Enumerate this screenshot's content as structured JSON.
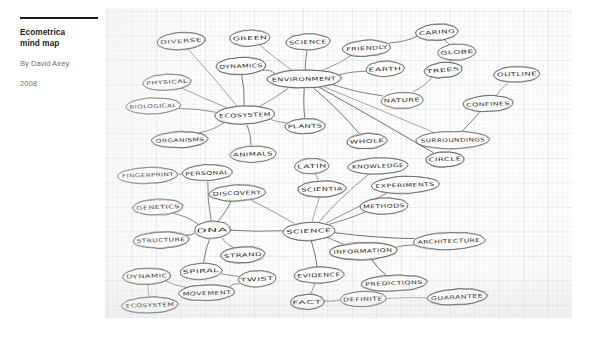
{
  "caption": {
    "title_line1": "Ecometrica",
    "title_line2": "mind map",
    "byline": "By David Airey",
    "year": "2008"
  },
  "artwork": {
    "medium": "hand-drawn mind map on graph paper",
    "ink_color": "#2c2c30",
    "paper_color": "#fdfdfc",
    "grid_color": "#8aa0b4"
  },
  "chart_data": {
    "type": "diagram",
    "title": "Ecometrica mind map",
    "nodes": [
      {
        "id": "diverse",
        "label": "DIVERSE",
        "x": 76,
        "y": 33,
        "rx": 24,
        "ry": 8.5,
        "rot": -4
      },
      {
        "id": "green",
        "label": "GREEN",
        "x": 145,
        "y": 30,
        "rx": 20,
        "ry": 8,
        "rot": -2
      },
      {
        "id": "science_top",
        "label": "SCIENCE",
        "x": 203,
        "y": 34,
        "rx": 22,
        "ry": 8,
        "rot": -2
      },
      {
        "id": "friendly",
        "label": "FRIENDLY",
        "x": 262,
        "y": 40,
        "rx": 24,
        "ry": 8,
        "rot": -3
      },
      {
        "id": "caring",
        "label": "CARING",
        "x": 332,
        "y": 24,
        "rx": 21,
        "ry": 8,
        "rot": -4
      },
      {
        "id": "globe",
        "label": "GLOBE",
        "x": 352,
        "y": 44,
        "rx": 19,
        "ry": 8,
        "rot": -3
      },
      {
        "id": "dynamics",
        "label": "DYNAMICS",
        "x": 136,
        "y": 58,
        "rx": 25,
        "ry": 8.5,
        "rot": -2
      },
      {
        "id": "earth",
        "label": "EARTH",
        "x": 280,
        "y": 61,
        "rx": 19,
        "ry": 7.5,
        "rot": -2
      },
      {
        "id": "trees",
        "label": "TREES",
        "x": 338,
        "y": 62,
        "rx": 19,
        "ry": 7.5,
        "rot": -5
      },
      {
        "id": "outline",
        "label": "OUTLINE",
        "x": 412,
        "y": 66,
        "rx": 23,
        "ry": 8,
        "rot": -2
      },
      {
        "id": "environment",
        "label": "ENVIRONMENT",
        "x": 199,
        "y": 71,
        "rx": 37,
        "ry": 9,
        "rot": -1
      },
      {
        "id": "physical",
        "label": "PHYSICAL",
        "x": 62,
        "y": 74,
        "rx": 24,
        "ry": 8,
        "rot": -3
      },
      {
        "id": "nature",
        "label": "NATURE",
        "x": 297,
        "y": 92,
        "rx": 21,
        "ry": 8,
        "rot": -2
      },
      {
        "id": "confines",
        "label": "CONFINES",
        "x": 383,
        "y": 96,
        "rx": 25,
        "ry": 8,
        "rot": -2
      },
      {
        "id": "biological",
        "label": "BIOLOGICAL",
        "x": 48,
        "y": 98,
        "rx": 27,
        "ry": 8,
        "rot": -2
      },
      {
        "id": "ecosystem_top",
        "label": "ECOSYSTEM",
        "x": 140,
        "y": 107,
        "rx": 30,
        "ry": 9,
        "rot": -2
      },
      {
        "id": "plants",
        "label": "PLANTS",
        "x": 200,
        "y": 118,
        "rx": 20,
        "ry": 7.5,
        "rot": -2
      },
      {
        "id": "whole",
        "label": "WHOLE",
        "x": 262,
        "y": 133,
        "rx": 20,
        "ry": 7.5,
        "rot": -3
      },
      {
        "id": "surroundings",
        "label": "SURROUNDINGS",
        "x": 348,
        "y": 132,
        "rx": 37,
        "ry": 8.5,
        "rot": -1
      },
      {
        "id": "organisms",
        "label": "ORGANISMS",
        "x": 75,
        "y": 132,
        "rx": 28,
        "ry": 8,
        "rot": -2
      },
      {
        "id": "animals",
        "label": "ANIMALS",
        "x": 148,
        "y": 146,
        "rx": 23,
        "ry": 8,
        "rot": -2
      },
      {
        "id": "circle",
        "label": "CIRCLE",
        "x": 340,
        "y": 151,
        "rx": 19,
        "ry": 7.5,
        "rot": -2
      },
      {
        "id": "latin",
        "label": "LATIN",
        "x": 207,
        "y": 158,
        "rx": 17,
        "ry": 7.5,
        "rot": -2
      },
      {
        "id": "knowledge",
        "label": "KNOWLEDGE",
        "x": 273,
        "y": 158,
        "rx": 30,
        "ry": 8,
        "rot": -2
      },
      {
        "id": "fingerprint",
        "label": "FINGERPRINT",
        "x": 43,
        "y": 167,
        "rx": 30,
        "ry": 8,
        "rot": -2
      },
      {
        "id": "personal",
        "label": "PERSONAL",
        "x": 102,
        "y": 165,
        "rx": 25,
        "ry": 8,
        "rot": -2
      },
      {
        "id": "experiments",
        "label": "EXPERIMENTS",
        "x": 300,
        "y": 177,
        "rx": 34,
        "ry": 8.5,
        "rot": -2
      },
      {
        "id": "scientia",
        "label": "SCIENTIA",
        "x": 217,
        "y": 181,
        "rx": 24,
        "ry": 8,
        "rot": -2
      },
      {
        "id": "discovery",
        "label": "DISCOVERY",
        "x": 132,
        "y": 185,
        "rx": 28,
        "ry": 8,
        "rot": -2
      },
      {
        "id": "methods",
        "label": "METHODS",
        "x": 279,
        "y": 198,
        "rx": 24,
        "ry": 8,
        "rot": -2
      },
      {
        "id": "genetics",
        "label": "GENETICS",
        "x": 53,
        "y": 199,
        "rx": 25,
        "ry": 8,
        "rot": -2
      },
      {
        "id": "science_main",
        "label": "SCIENCE",
        "x": 204,
        "y": 223,
        "rx": 26,
        "ry": 9,
        "rot": -2
      },
      {
        "id": "dna",
        "label": "DNA",
        "x": 107,
        "y": 222,
        "rx": 18,
        "ry": 8.5,
        "rot": -2
      },
      {
        "id": "architecture",
        "label": "ARCHITECTURE",
        "x": 344,
        "y": 233,
        "rx": 36,
        "ry": 8.5,
        "rot": -2
      },
      {
        "id": "information",
        "label": "INFORMATION",
        "x": 258,
        "y": 243,
        "rx": 34,
        "ry": 8.5,
        "rot": -2
      },
      {
        "id": "structure",
        "label": "STRUCTURE",
        "x": 56,
        "y": 232,
        "rx": 28,
        "ry": 8,
        "rot": -2
      },
      {
        "id": "strand",
        "label": "STRAND",
        "x": 138,
        "y": 247,
        "rx": 22,
        "ry": 8,
        "rot": -3
      },
      {
        "id": "spiral",
        "label": "SPIRAL",
        "x": 96,
        "y": 263,
        "rx": 21,
        "ry": 8,
        "rot": -3
      },
      {
        "id": "twist",
        "label": "TWIST",
        "x": 152,
        "y": 271,
        "rx": 19,
        "ry": 8,
        "rot": -3
      },
      {
        "id": "evidence",
        "label": "EVIDENCE",
        "x": 214,
        "y": 267,
        "rx": 25,
        "ry": 8,
        "rot": -2
      },
      {
        "id": "predictions",
        "label": "PREDICTIONS",
        "x": 289,
        "y": 275,
        "rx": 33,
        "ry": 8,
        "rot": -2
      },
      {
        "id": "dynamic",
        "label": "DYNAMIC",
        "x": 42,
        "y": 268,
        "rx": 24,
        "ry": 8,
        "rot": -2
      },
      {
        "id": "movement",
        "label": "MOVEMENT",
        "x": 102,
        "y": 285,
        "rx": 28,
        "ry": 8,
        "rot": -2
      },
      {
        "id": "fact",
        "label": "FACT",
        "x": 202,
        "y": 294,
        "rx": 17,
        "ry": 7.5,
        "rot": -2
      },
      {
        "id": "definite",
        "label": "DEFINITE",
        "x": 258,
        "y": 291,
        "rx": 23,
        "ry": 7.5,
        "rot": -2
      },
      {
        "id": "guarantee",
        "label": "GUARANTEE",
        "x": 352,
        "y": 289,
        "rx": 30,
        "ry": 8,
        "rot": -3
      },
      {
        "id": "ecosystem_bot",
        "label": "ECOSYSTEM",
        "x": 45,
        "y": 297,
        "rx": 28,
        "ry": 8,
        "rot": -2
      }
    ],
    "edges": [
      [
        "environment",
        "green"
      ],
      [
        "environment",
        "science_top"
      ],
      [
        "environment",
        "friendly"
      ],
      [
        "environment",
        "earth"
      ],
      [
        "environment",
        "nature"
      ],
      [
        "environment",
        "whole"
      ],
      [
        "environment",
        "surroundings"
      ],
      [
        "environment",
        "plants"
      ],
      [
        "environment",
        "ecosystem_top"
      ],
      [
        "environment",
        "dynamics"
      ],
      [
        "environment",
        "circle"
      ],
      [
        "friendly",
        "caring"
      ],
      [
        "caring",
        "globe"
      ],
      [
        "globe",
        "trees"
      ],
      [
        "trees",
        "nature"
      ],
      [
        "outline",
        "confines"
      ],
      [
        "confines",
        "surroundings"
      ],
      [
        "ecosystem_top",
        "diverse"
      ],
      [
        "ecosystem_top",
        "physical"
      ],
      [
        "ecosystem_top",
        "biological"
      ],
      [
        "ecosystem_top",
        "organisms"
      ],
      [
        "ecosystem_top",
        "animals"
      ],
      [
        "ecosystem_top",
        "dynamics"
      ],
      [
        "ecosystem_top",
        "plants"
      ],
      [
        "science_main",
        "scientia"
      ],
      [
        "science_main",
        "knowledge"
      ],
      [
        "science_main",
        "experiments"
      ],
      [
        "science_main",
        "methods"
      ],
      [
        "science_main",
        "discovery"
      ],
      [
        "science_main",
        "information"
      ],
      [
        "science_main",
        "evidence"
      ],
      [
        "science_main",
        "dna"
      ],
      [
        "science_main",
        "architecture"
      ],
      [
        "scientia",
        "latin"
      ],
      [
        "dna",
        "personal"
      ],
      [
        "dna",
        "genetics"
      ],
      [
        "dna",
        "structure"
      ],
      [
        "dna",
        "strand"
      ],
      [
        "dna",
        "spiral"
      ],
      [
        "dna",
        "discovery"
      ],
      [
        "personal",
        "fingerprint"
      ],
      [
        "spiral",
        "twist"
      ],
      [
        "twist",
        "movement"
      ],
      [
        "movement",
        "dynamic"
      ],
      [
        "dynamic",
        "ecosystem_bot"
      ],
      [
        "information",
        "predictions"
      ],
      [
        "information",
        "architecture"
      ],
      [
        "evidence",
        "fact"
      ],
      [
        "fact",
        "definite"
      ],
      [
        "definite",
        "guarantee"
      ]
    ]
  }
}
